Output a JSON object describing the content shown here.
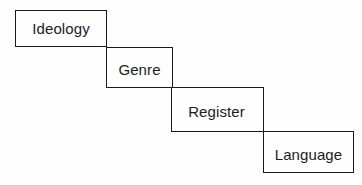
{
  "diagram": {
    "type": "staircase-hierarchy",
    "levels": [
      {
        "label": "Ideology"
      },
      {
        "label": "Genre"
      },
      {
        "label": "Register"
      },
      {
        "label": "Language"
      }
    ]
  }
}
